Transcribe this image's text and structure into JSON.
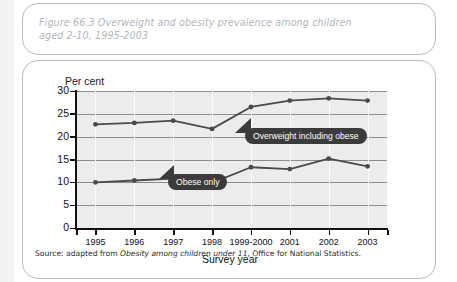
{
  "figure": {
    "title": "Figure 66.3  Overweight and obesity prevalence among children aged 2-10, 1995-2003",
    "source_prefix": "Source: adapted from ",
    "source_italic": "Obesity among children under 11",
    "source_suffix": ", Office for National Statistics."
  },
  "colors": {
    "page_background": "#f2f2f2",
    "card_background": "#ffffff",
    "card_border": "#b9bcc0",
    "title_text": "#b3b7bb",
    "plot_background": "#ececec",
    "gridline": "#8d8d8d",
    "vertical_gridline": "#fafafa",
    "axis": "#111111",
    "series_line": "#4a4a4a",
    "callout_background": "#3b3b3b",
    "callout_text": "#ffffff"
  },
  "chart_data": {
    "type": "line",
    "title": "Overweight and obesity prevalence among children aged 2-10, 1995-2003",
    "xlabel": "Survey year",
    "ylabel": "Per cent",
    "categories": [
      "1995",
      "1996",
      "1997",
      "1998",
      "1999-2000",
      "2001",
      "2002",
      "2003"
    ],
    "yticks": [
      0,
      5,
      10,
      15,
      20,
      25,
      30
    ],
    "ylim": [
      0,
      30
    ],
    "grid": true,
    "legend": "inline-callouts",
    "series": [
      {
        "name": "Overweight including obese",
        "values": [
          22.7,
          23.0,
          23.5,
          21.7,
          26.5,
          27.9,
          28.4,
          27.9
        ]
      },
      {
        "name": "Obese only",
        "values": [
          10.0,
          10.4,
          10.8,
          9.9,
          13.3,
          12.9,
          15.2,
          13.5
        ]
      }
    ],
    "annotations": [
      {
        "text": "Overweight including obese",
        "series": "Overweight including obese"
      },
      {
        "text": "Obese only",
        "series": "Obese only"
      }
    ]
  }
}
